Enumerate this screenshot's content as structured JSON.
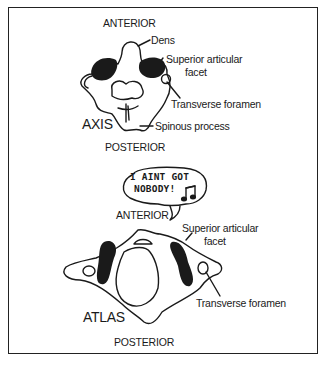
{
  "axis_diagram": {
    "title": "AXIS",
    "orientation_top": "ANTERIOR",
    "orientation_bottom": "POSTERIOR",
    "labels": {
      "dens": "Dens",
      "superior_articular_facet_line1": "Superior articular",
      "superior_articular_facet_line2": "facet",
      "transverse_foramen": "Transverse foramen",
      "spinous_process": "Spinous process"
    }
  },
  "speech_bubble": {
    "line1": "I AINT GOT",
    "line2": "NOBODY!",
    "icon": "music-note-icon"
  },
  "atlas_diagram": {
    "title": "ATLAS",
    "orientation_top": "ANTERIOR",
    "orientation_bottom": "POSTERIOR",
    "labels": {
      "superior_articular_facet_line1": "Superior articular",
      "superior_articular_facet_line2": "facet",
      "transverse_foramen": "Transverse foramen"
    }
  },
  "colors": {
    "ink": "#1a1a1a",
    "background": "#ffffff"
  }
}
